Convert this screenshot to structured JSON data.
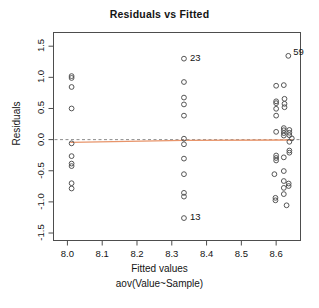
{
  "chart_data": {
    "type": "scatter",
    "title": "Residuals vs Fitted",
    "xlabel": "Fitted values",
    "xlabel2": "aov(Value~Sample)",
    "ylabel": "Residuals",
    "xlim": [
      7.96,
      8.67
    ],
    "ylim": [
      -1.62,
      1.72
    ],
    "xticks": [
      "8.0",
      "8.1",
      "8.2",
      "8.3",
      "8.4",
      "8.5",
      "8.6"
    ],
    "xtick_values": [
      8.0,
      8.1,
      8.2,
      8.3,
      8.4,
      8.5,
      8.6
    ],
    "yticks": [
      "1.5",
      "1.0",
      "0.5",
      "0.0",
      "-0.5",
      "-1.0",
      "-1.5"
    ],
    "ytick_values": [
      1.5,
      1.0,
      0.5,
      0.0,
      -0.5,
      -1.0,
      -1.5
    ],
    "grid": false,
    "legend": "none",
    "zero_line": {
      "y": 0.0,
      "style": "dashed",
      "color": "#8c8c8c"
    },
    "smoother": {
      "color": "#e8956b",
      "style": "solid",
      "points": [
        {
          "x": 8.01,
          "y": -0.045
        },
        {
          "x": 8.335,
          "y": -0.012
        },
        {
          "x": 8.645,
          "y": -0.005
        }
      ]
    },
    "point_color": "#555555",
    "point_marker": "open-circle",
    "annotations": [
      {
        "label": "23",
        "x": 8.335,
        "y": 1.3,
        "dx": 6,
        "dy": 0
      },
      {
        "label": "13",
        "x": 8.335,
        "y": -1.26,
        "dx": 6,
        "dy": 0
      },
      {
        "label": "59",
        "x": 8.635,
        "y": 1.345,
        "dx": 5,
        "dy": 3
      }
    ],
    "points": [
      {
        "x": 8.012,
        "y": 1.02
      },
      {
        "x": 8.012,
        "y": 0.99
      },
      {
        "x": 8.012,
        "y": 0.845
      },
      {
        "x": 8.012,
        "y": 0.5
      },
      {
        "x": 8.012,
        "y": -0.06
      },
      {
        "x": 8.012,
        "y": -0.265
      },
      {
        "x": 8.012,
        "y": -0.385
      },
      {
        "x": 8.012,
        "y": -0.425
      },
      {
        "x": 8.012,
        "y": -0.7
      },
      {
        "x": 8.012,
        "y": -0.785
      },
      {
        "x": 8.335,
        "y": 1.3
      },
      {
        "x": 8.335,
        "y": 0.925
      },
      {
        "x": 8.335,
        "y": 0.675
      },
      {
        "x": 8.335,
        "y": 0.565
      },
      {
        "x": 8.335,
        "y": 0.385
      },
      {
        "x": 8.335,
        "y": 0.015
      },
      {
        "x": 8.335,
        "y": -0.075
      },
      {
        "x": 8.335,
        "y": -0.305
      },
      {
        "x": 8.335,
        "y": -0.555
      },
      {
        "x": 8.335,
        "y": -0.855
      },
      {
        "x": 8.335,
        "y": -0.915
      },
      {
        "x": 8.335,
        "y": -1.26
      },
      {
        "x": 8.635,
        "y": 1.345
      },
      {
        "x": 8.6,
        "y": 0.865
      },
      {
        "x": 8.622,
        "y": 0.875
      },
      {
        "x": 8.6,
        "y": 0.615
      },
      {
        "x": 8.6,
        "y": 0.585
      },
      {
        "x": 8.624,
        "y": 0.655
      },
      {
        "x": 8.624,
        "y": 0.575
      },
      {
        "x": 8.6,
        "y": 0.495
      },
      {
        "x": 8.624,
        "y": 0.52
      },
      {
        "x": 8.6,
        "y": 0.385
      },
      {
        "x": 8.6,
        "y": 0.125
      },
      {
        "x": 8.622,
        "y": 0.185
      },
      {
        "x": 8.622,
        "y": 0.15
      },
      {
        "x": 8.638,
        "y": 0.155
      },
      {
        "x": 8.622,
        "y": 0.105
      },
      {
        "x": 8.638,
        "y": 0.11
      },
      {
        "x": 8.622,
        "y": 0.065
      },
      {
        "x": 8.638,
        "y": 0.07
      },
      {
        "x": 8.645,
        "y": 0.02
      },
      {
        "x": 8.638,
        "y": -0.035
      },
      {
        "x": 8.6,
        "y": -0.255
      },
      {
        "x": 8.6,
        "y": -0.295
      },
      {
        "x": 8.6,
        "y": -0.335
      },
      {
        "x": 8.622,
        "y": -0.285
      },
      {
        "x": 8.638,
        "y": -0.175
      },
      {
        "x": 8.638,
        "y": -0.21
      },
      {
        "x": 8.595,
        "y": -0.555
      },
      {
        "x": 8.622,
        "y": -0.505
      },
      {
        "x": 8.622,
        "y": -0.665
      },
      {
        "x": 8.636,
        "y": -0.705
      },
      {
        "x": 8.636,
        "y": -0.745
      },
      {
        "x": 8.622,
        "y": -0.775
      },
      {
        "x": 8.598,
        "y": -0.935
      },
      {
        "x": 8.598,
        "y": -0.975
      },
      {
        "x": 8.622,
        "y": -0.875
      },
      {
        "x": 8.63,
        "y": -1.055
      }
    ]
  }
}
